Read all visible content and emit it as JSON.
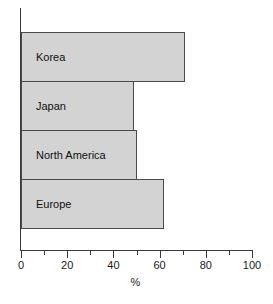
{
  "chart_data": {
    "type": "bar",
    "orientation": "horizontal",
    "title": "",
    "subtitle": "",
    "xlabel": "%",
    "ylabel": "",
    "categories": [
      "Korea",
      "Japan",
      "North America",
      "Europe"
    ],
    "values": [
      71,
      49,
      50,
      62
    ],
    "series": [
      {
        "name": "",
        "values": [
          71,
          49,
          50,
          62
        ]
      }
    ],
    "xlim": [
      0,
      100
    ],
    "xticks": [
      0,
      20,
      40,
      60,
      80,
      100
    ],
    "xtick_labels": [
      "0",
      "20",
      "40",
      "60",
      "80",
      "100"
    ],
    "minor_xticks": [
      10,
      30,
      50,
      70,
      90
    ],
    "grid": false,
    "legend": false,
    "legend_position": "none",
    "bar_fill_color": "#d3d3d3",
    "bar_border_color": "#4a4a4a",
    "axis_color": "#3a3a3a",
    "background_color": "#ffffff",
    "bar_label_position": "inside-left"
  },
  "bars": [
    {
      "label": "Korea",
      "value": 71
    },
    {
      "label": "Japan",
      "value": 49
    },
    {
      "label": "North America",
      "value": 50
    },
    {
      "label": "Europe",
      "value": 62
    }
  ],
  "x_axis": {
    "title": "%",
    "ticks": [
      {
        "value": 0,
        "label": "0"
      },
      {
        "value": 20,
        "label": "20"
      },
      {
        "value": 40,
        "label": "40"
      },
      {
        "value": 60,
        "label": "60"
      },
      {
        "value": 80,
        "label": "80"
      },
      {
        "value": 100,
        "label": "100"
      }
    ]
  }
}
